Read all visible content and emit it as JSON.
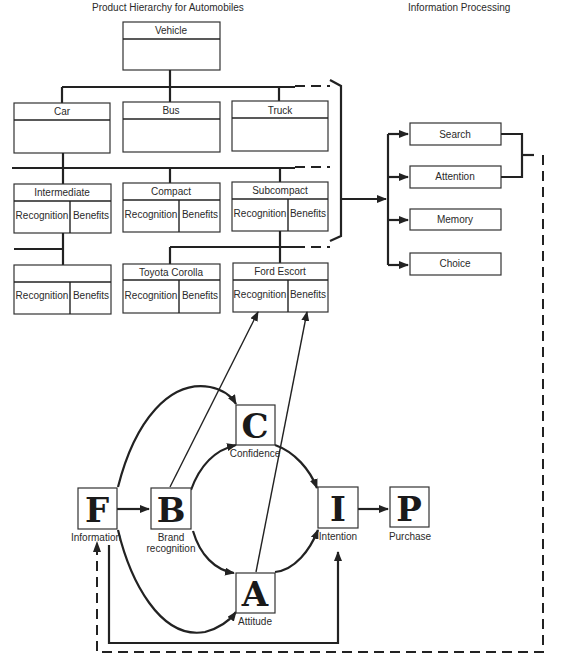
{
  "titles": {
    "hierarchy": "Product Hierarchy for Automobiles",
    "processing": "Information Processing"
  },
  "hierarchy": {
    "level0": {
      "label": "Vehicle"
    },
    "level1": [
      {
        "label": "Car"
      },
      {
        "label": "Bus"
      },
      {
        "label": "Truck"
      }
    ],
    "level2": [
      {
        "label": "Intermediate",
        "left": "Recognition",
        "right": "Benefits"
      },
      {
        "label": "Compact",
        "left": "Recognition",
        "right": "Benefits"
      },
      {
        "label": "Subcompact",
        "left": "Recognition",
        "right": "Benefits"
      }
    ],
    "level3": [
      {
        "label": "",
        "left": "Recognition",
        "right": "Benefits"
      },
      {
        "label": "Toyota Corolla",
        "left": "Recognition",
        "right": "Benefits"
      },
      {
        "label": "Ford Escort",
        "left": "Recognition",
        "right": "Benefits"
      }
    ]
  },
  "processing": {
    "steps": [
      {
        "label": "Search"
      },
      {
        "label": "Attention"
      },
      {
        "label": "Memory"
      },
      {
        "label": "Choice"
      }
    ]
  },
  "model": {
    "nodes": {
      "F": {
        "letter": "F",
        "caption": "Information"
      },
      "B": {
        "letter": "B",
        "caption1": "Brand",
        "caption2": "recognition"
      },
      "C": {
        "letter": "C",
        "caption": "Confidence"
      },
      "A": {
        "letter": "A",
        "caption": "Attitude"
      },
      "I": {
        "letter": "I",
        "caption": "Intention"
      },
      "P": {
        "letter": "P",
        "caption": "Purchase"
      }
    }
  }
}
